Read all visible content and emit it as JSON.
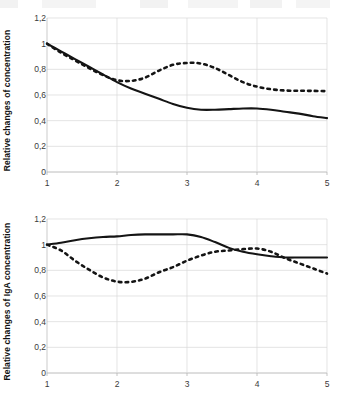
{
  "figure": {
    "background_color": "#ffffff",
    "line_color": "#141414",
    "grid_color": "#d8d8d8",
    "axis_color": "#b4b4b4"
  },
  "chart_data": [
    {
      "type": "line",
      "title": "",
      "xlabel": "",
      "ylabel": "Relative changes of concentration",
      "xlim": [
        1,
        5
      ],
      "ylim": [
        0,
        1.2
      ],
      "grid": true,
      "legend": "none",
      "xticks": [
        "1",
        "2",
        "3",
        "4",
        "5"
      ],
      "xtick_values": [
        1,
        2,
        3,
        4,
        5
      ],
      "yticks": [
        "0",
        "0,2",
        "0,4",
        "0,6",
        "0,8",
        "1",
        "1,2"
      ],
      "ytick_values": [
        0,
        0.2,
        0.4,
        0.6,
        0.8,
        1.0,
        1.2
      ],
      "series": [
        {
          "name": "solid-curve",
          "style": "solid",
          "x": [
            1.0,
            1.2,
            1.4,
            1.6,
            1.8,
            2.0,
            2.2,
            2.4,
            2.6,
            2.8,
            3.0,
            3.2,
            3.4,
            3.6,
            3.8,
            4.0,
            4.2,
            4.4,
            4.6,
            4.8,
            5.0
          ],
          "values": [
            1.0,
            0.94,
            0.88,
            0.82,
            0.76,
            0.7,
            0.65,
            0.61,
            0.57,
            0.53,
            0.5,
            0.485,
            0.485,
            0.49,
            0.495,
            0.495,
            0.485,
            0.47,
            0.455,
            0.435,
            0.42
          ]
        },
        {
          "name": "dashed-curve",
          "style": "dashed",
          "x": [
            1.0,
            1.2,
            1.4,
            1.6,
            1.8,
            2.0,
            2.2,
            2.4,
            2.6,
            2.8,
            3.0,
            3.2,
            3.4,
            3.6,
            3.8,
            4.0,
            4.2,
            4.4,
            4.6,
            4.8,
            5.0
          ],
          "values": [
            1.0,
            0.93,
            0.87,
            0.81,
            0.755,
            0.715,
            0.71,
            0.735,
            0.79,
            0.835,
            0.85,
            0.845,
            0.81,
            0.755,
            0.7,
            0.665,
            0.645,
            0.635,
            0.633,
            0.632,
            0.63
          ]
        }
      ]
    },
    {
      "type": "line",
      "title": "",
      "xlabel": "",
      "ylabel": "Relative changes of IgA concentration",
      "xlim": [
        1,
        5
      ],
      "ylim": [
        0,
        1.2
      ],
      "grid": true,
      "legend": "none",
      "xticks": [
        "1",
        "2",
        "3",
        "4",
        "5"
      ],
      "xtick_values": [
        1,
        2,
        3,
        4,
        5
      ],
      "yticks": [
        "0",
        "0,2",
        "0,4",
        "0,6",
        "0,8",
        "1",
        "1,2"
      ],
      "ytick_values": [
        0,
        0.2,
        0.4,
        0.6,
        0.8,
        1.0,
        1.2
      ],
      "series": [
        {
          "name": "solid-curve",
          "style": "solid",
          "x": [
            1.0,
            1.2,
            1.4,
            1.6,
            1.8,
            2.0,
            2.2,
            2.4,
            2.6,
            2.8,
            3.0,
            3.2,
            3.4,
            3.6,
            3.8,
            4.0,
            4.2,
            4.4,
            4.6,
            4.8,
            5.0
          ],
          "values": [
            1.0,
            1.015,
            1.035,
            1.05,
            1.06,
            1.065,
            1.075,
            1.08,
            1.08,
            1.08,
            1.08,
            1.06,
            1.02,
            0.975,
            0.945,
            0.925,
            0.91,
            0.9,
            0.9,
            0.9,
            0.9
          ]
        },
        {
          "name": "dashed-curve",
          "style": "dashed",
          "x": [
            1.0,
            1.2,
            1.4,
            1.6,
            1.8,
            2.0,
            2.2,
            2.4,
            2.6,
            2.8,
            3.0,
            3.2,
            3.4,
            3.6,
            3.8,
            4.0,
            4.2,
            4.4,
            4.6,
            4.8,
            5.0
          ],
          "values": [
            1.0,
            0.955,
            0.875,
            0.805,
            0.745,
            0.712,
            0.71,
            0.735,
            0.785,
            0.825,
            0.875,
            0.915,
            0.945,
            0.955,
            0.965,
            0.97,
            0.945,
            0.895,
            0.855,
            0.815,
            0.775
          ]
        }
      ]
    }
  ]
}
